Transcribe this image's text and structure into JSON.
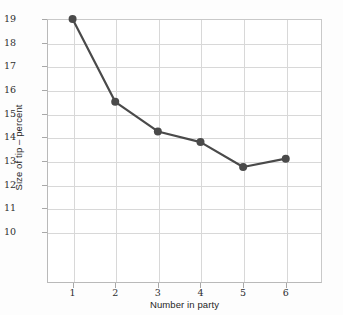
{
  "chart_data": {
    "type": "line",
    "title": "",
    "xlabel": "Number in party",
    "ylabel": "Size of tip – percent",
    "x": [
      1,
      2,
      3,
      4,
      5,
      6
    ],
    "values": [
      19.0,
      15.5,
      14.25,
      13.8,
      12.75,
      13.1
    ],
    "xtick_labels": [
      "1",
      "2",
      "3",
      "4",
      "5",
      "6"
    ],
    "ytick_labels": [
      "19",
      "18",
      "17",
      "16",
      "15",
      "14",
      "13",
      "12",
      "11",
      "10"
    ],
    "ytick_values": [
      19,
      18,
      17,
      16,
      15,
      14,
      13,
      12,
      11,
      10
    ],
    "xlim": [
      0.4,
      6.85
    ],
    "ylim": [
      7.85,
      19.0
    ],
    "grid": true,
    "legend": null,
    "series_color": "#4a4a4a",
    "grid_color": "#d8d8d8",
    "axis_color": "#b9b9b9",
    "background_color": "#ffffff",
    "marker": "circle",
    "marker_size": 4
  }
}
